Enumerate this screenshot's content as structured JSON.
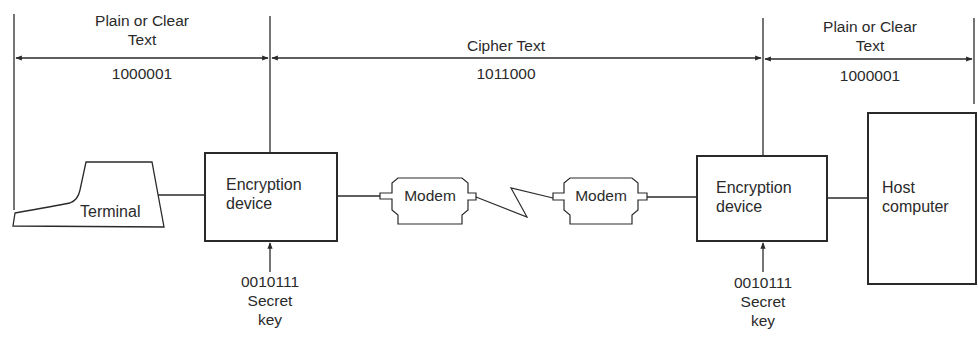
{
  "segments": [
    {
      "title": "Plain or Clear\nText",
      "title_line1": "Plain or Clear",
      "title_line2": "Text",
      "bits": "1000001"
    },
    {
      "title": "Cipher Text",
      "bits": "1011000"
    },
    {
      "title": "Plain or Clear\nText",
      "title_line1": "Plain or Clear",
      "title_line2": "Text",
      "bits": "1000001"
    }
  ],
  "nodes": {
    "terminal": {
      "label": "Terminal"
    },
    "encryption_left": {
      "line1": "Encryption",
      "line2": "device"
    },
    "modem_left": {
      "label": "Modem"
    },
    "modem_right": {
      "label": "Modem"
    },
    "encryption_right": {
      "line1": "Encryption",
      "line2": "device"
    },
    "host": {
      "line1": "Host",
      "line2": "computer"
    }
  },
  "keys": [
    {
      "bits": "0010111",
      "line1": "Secret",
      "line2": "key"
    },
    {
      "bits": "0010111",
      "line1": "Secret",
      "line2": "key"
    }
  ],
  "colors": {
    "stroke": "#2a2a2a",
    "background": "#ffffff"
  }
}
